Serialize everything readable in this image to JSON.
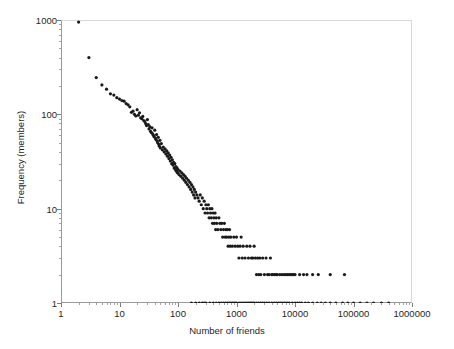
{
  "chart_data": {
    "type": "scatter",
    "title": "",
    "xlabel": "Number of friends",
    "ylabel": "Frequency (members)",
    "xscale": "log",
    "yscale": "log",
    "xlim": [
      1,
      1000000
    ],
    "ylim": [
      1,
      1000
    ],
    "grid": false,
    "legend": null,
    "marker": {
      "shape": "dot",
      "color": "#1a1a1a",
      "size": 1.6
    },
    "xticks": [
      1,
      10,
      100,
      1000,
      10000,
      100000,
      1000000
    ],
    "xticklabels": [
      "1",
      "10",
      "100",
      "1000",
      "10000",
      "100000",
      "1000000"
    ],
    "yticks": [
      1,
      10,
      100,
      1000
    ],
    "yticklabels": [
      "1",
      "10",
      "100",
      "1000"
    ],
    "points": [
      [
        2,
        950
      ],
      [
        3,
        400
      ],
      [
        4,
        245
      ],
      [
        5,
        205
      ],
      [
        6,
        185
      ],
      [
        7,
        165
      ],
      [
        8,
        160
      ],
      [
        9,
        150
      ],
      [
        10,
        145
      ],
      [
        11,
        140
      ],
      [
        12,
        138
      ],
      [
        13,
        130
      ],
      [
        14,
        126
      ],
      [
        15,
        120
      ],
      [
        16,
        105
      ],
      [
        17,
        108
      ],
      [
        18,
        100
      ],
      [
        19,
        96
      ],
      [
        20,
        112
      ],
      [
        21,
        98
      ],
      [
        22,
        104
      ],
      [
        23,
        92
      ],
      [
        24,
        90
      ],
      [
        25,
        95
      ],
      [
        26,
        86
      ],
      [
        27,
        84
      ],
      [
        28,
        80
      ],
      [
        29,
        76
      ],
      [
        30,
        88
      ],
      [
        31,
        78
      ],
      [
        32,
        70
      ],
      [
        33,
        74
      ],
      [
        34,
        66
      ],
      [
        35,
        64
      ],
      [
        36,
        72
      ],
      [
        37,
        62
      ],
      [
        38,
        60
      ],
      [
        39,
        58
      ],
      [
        40,
        68
      ],
      [
        41,
        56
      ],
      [
        42,
        54
      ],
      [
        43,
        61
      ],
      [
        44,
        52
      ],
      [
        45,
        50
      ],
      [
        46,
        57
      ],
      [
        47,
        48
      ],
      [
        48,
        46
      ],
      [
        49,
        53
      ],
      [
        50,
        44
      ],
      [
        52,
        49
      ],
      [
        54,
        42
      ],
      [
        56,
        45
      ],
      [
        58,
        40
      ],
      [
        60,
        43
      ],
      [
        62,
        38
      ],
      [
        64,
        41
      ],
      [
        66,
        36
      ],
      [
        68,
        39
      ],
      [
        70,
        34
      ],
      [
        72,
        37
      ],
      [
        74,
        32
      ],
      [
        76,
        35
      ],
      [
        78,
        30
      ],
      [
        80,
        33
      ],
      [
        82,
        29
      ],
      [
        84,
        31
      ],
      [
        86,
        27
      ],
      [
        88,
        30
      ],
      [
        90,
        26
      ],
      [
        92,
        28
      ],
      [
        94,
        25
      ],
      [
        96,
        27
      ],
      [
        98,
        24
      ],
      [
        100,
        26
      ],
      [
        104,
        23
      ],
      [
        108,
        25
      ],
      [
        112,
        22
      ],
      [
        116,
        24
      ],
      [
        120,
        21
      ],
      [
        124,
        23
      ],
      [
        128,
        20
      ],
      [
        132,
        22
      ],
      [
        136,
        19
      ],
      [
        140,
        21
      ],
      [
        145,
        18
      ],
      [
        150,
        20
      ],
      [
        155,
        17
      ],
      [
        160,
        19
      ],
      [
        165,
        16
      ],
      [
        170,
        18
      ],
      [
        175,
        15
      ],
      [
        180,
        17
      ],
      [
        185,
        14
      ],
      [
        190,
        16
      ],
      [
        195,
        13
      ],
      [
        200,
        15
      ],
      [
        210,
        14
      ],
      [
        220,
        13
      ],
      [
        230,
        12
      ],
      [
        240,
        14
      ],
      [
        250,
        11
      ],
      [
        260,
        13
      ],
      [
        270,
        10
      ],
      [
        280,
        12
      ],
      [
        290,
        9
      ],
      [
        300,
        11
      ],
      [
        310,
        10
      ],
      [
        320,
        9
      ],
      [
        330,
        11
      ],
      [
        340,
        8
      ],
      [
        350,
        10
      ],
      [
        360,
        9
      ],
      [
        370,
        8
      ],
      [
        380,
        10
      ],
      [
        390,
        7
      ],
      [
        400,
        9
      ],
      [
        410,
        8
      ],
      [
        420,
        7
      ],
      [
        430,
        9
      ],
      [
        440,
        6
      ],
      [
        450,
        8
      ],
      [
        460,
        7
      ],
      [
        480,
        6
      ],
      [
        500,
        8
      ],
      [
        520,
        7
      ],
      [
        540,
        6
      ],
      [
        560,
        7
      ],
      [
        580,
        5
      ],
      [
        600,
        6
      ],
      [
        620,
        7
      ],
      [
        640,
        5
      ],
      [
        660,
        6
      ],
      [
        680,
        5
      ],
      [
        700,
        6
      ],
      [
        720,
        4
      ],
      [
        740,
        5
      ],
      [
        760,
        6
      ],
      [
        780,
        4
      ],
      [
        800,
        5
      ],
      [
        850,
        4
      ],
      [
        900,
        5
      ],
      [
        950,
        4
      ],
      [
        1000,
        5
      ],
      [
        1050,
        4
      ],
      [
        1100,
        3
      ],
      [
        1150,
        4
      ],
      [
        1200,
        5
      ],
      [
        1250,
        3
      ],
      [
        1300,
        4
      ],
      [
        1400,
        3
      ],
      [
        1500,
        4
      ],
      [
        1600,
        3
      ],
      [
        1700,
        4
      ],
      [
        1800,
        3
      ],
      [
        1900,
        3
      ],
      [
        2000,
        4
      ],
      [
        2100,
        3
      ],
      [
        2200,
        2
      ],
      [
        2300,
        3
      ],
      [
        2400,
        2
      ],
      [
        2500,
        3
      ],
      [
        2600,
        2
      ],
      [
        2800,
        3
      ],
      [
        3000,
        2
      ],
      [
        3200,
        3
      ],
      [
        3400,
        2
      ],
      [
        3600,
        2
      ],
      [
        3800,
        3
      ],
      [
        4000,
        2
      ],
      [
        4200,
        2
      ],
      [
        4500,
        2
      ],
      [
        4800,
        2
      ],
      [
        5000,
        2
      ],
      [
        5500,
        2
      ],
      [
        6000,
        2
      ],
      [
        6500,
        2
      ],
      [
        7000,
        2
      ],
      [
        7500,
        2
      ],
      [
        8000,
        2
      ],
      [
        8500,
        2
      ],
      [
        9000,
        2
      ],
      [
        9500,
        2
      ],
      [
        10000,
        2
      ],
      [
        12000,
        2
      ],
      [
        14000,
        2
      ],
      [
        16000,
        2
      ],
      [
        20000,
        2
      ],
      [
        25000,
        2
      ],
      [
        40000,
        2
      ],
      [
        70000,
        2
      ],
      [
        300,
        1
      ],
      [
        350,
        1
      ],
      [
        400,
        1
      ],
      [
        450,
        1
      ],
      [
        500,
        1
      ],
      [
        550,
        1
      ],
      [
        600,
        1
      ],
      [
        650,
        1
      ],
      [
        700,
        1
      ],
      [
        750,
        1
      ],
      [
        800,
        1
      ],
      [
        850,
        1
      ],
      [
        900,
        1
      ],
      [
        950,
        1
      ],
      [
        1000,
        1
      ],
      [
        1100,
        1
      ],
      [
        1200,
        1
      ],
      [
        1300,
        1
      ],
      [
        1400,
        1
      ],
      [
        1500,
        1
      ],
      [
        1600,
        1
      ],
      [
        1700,
        1
      ],
      [
        1800,
        1
      ],
      [
        1900,
        1
      ],
      [
        2000,
        1
      ],
      [
        2200,
        1
      ],
      [
        2400,
        1
      ],
      [
        2600,
        1
      ],
      [
        2800,
        1
      ],
      [
        3000,
        1
      ],
      [
        3300,
        1
      ],
      [
        3600,
        1
      ],
      [
        4000,
        1
      ],
      [
        4400,
        1
      ],
      [
        4800,
        1
      ],
      [
        5200,
        1
      ],
      [
        5600,
        1
      ],
      [
        6000,
        1
      ],
      [
        6500,
        1
      ],
      [
        7000,
        1
      ],
      [
        7500,
        1
      ],
      [
        8000,
        1
      ],
      [
        9000,
        1
      ],
      [
        10000,
        1
      ],
      [
        11000,
        1
      ],
      [
        12000,
        1
      ],
      [
        13000,
        1
      ],
      [
        15000,
        1
      ],
      [
        17000,
        1
      ],
      [
        20000,
        1
      ],
      [
        24000,
        1
      ],
      [
        28000,
        1
      ],
      [
        33000,
        1
      ],
      [
        40000,
        1
      ],
      [
        50000,
        1
      ],
      [
        65000,
        1
      ],
      [
        80000,
        1
      ],
      [
        100000,
        1
      ],
      [
        130000,
        1
      ],
      [
        170000,
        1
      ],
      [
        220000,
        1
      ],
      [
        300000,
        1
      ],
      [
        400000,
        1
      ],
      [
        170,
        1
      ],
      [
        200,
        1
      ],
      [
        230,
        1
      ],
      [
        260,
        1
      ],
      [
        280,
        1
      ]
    ]
  }
}
